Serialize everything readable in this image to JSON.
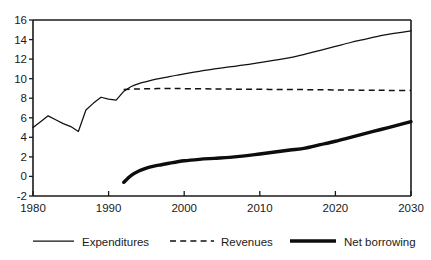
{
  "chart_data": {
    "type": "line",
    "title": "",
    "subtitle": "",
    "xlabel": "",
    "ylabel": "",
    "xlim": [
      1980,
      2030
    ],
    "ylim": [
      -2,
      16
    ],
    "xticks": [
      1980,
      1990,
      2000,
      2010,
      2020,
      2030
    ],
    "xticklabels": [
      "1980",
      "1990",
      "2000",
      "2010",
      "2020",
      "2030"
    ],
    "yticks": [
      -2,
      0,
      2,
      4,
      6,
      8,
      10,
      12,
      14,
      16
    ],
    "yticklabels": [
      "-2",
      "0",
      "2",
      "4",
      "6",
      "8",
      "10",
      "12",
      "14",
      "16"
    ],
    "grid": false,
    "legend_position": "bottom",
    "series": [
      {
        "name": "Expenditures",
        "style": "solid-thin",
        "x": [
          1980,
          1981,
          1982,
          1983,
          1984,
          1985,
          1986,
          1987,
          1988,
          1989,
          1990,
          1991,
          1992,
          1993,
          1994,
          1995,
          1996,
          1997,
          1998,
          1999,
          2000,
          2002,
          2004,
          2006,
          2008,
          2010,
          2012,
          2014,
          2016,
          2018,
          2020,
          2022,
          2024,
          2026,
          2028,
          2030
        ],
        "values": [
          5.0,
          5.6,
          6.2,
          5.8,
          5.4,
          5.1,
          4.6,
          6.8,
          7.5,
          8.1,
          7.9,
          7.8,
          8.7,
          9.2,
          9.5,
          9.7,
          9.9,
          10.05,
          10.2,
          10.35,
          10.5,
          10.75,
          11.0,
          11.2,
          11.4,
          11.65,
          11.9,
          12.15,
          12.5,
          12.9,
          13.3,
          13.7,
          14.05,
          14.4,
          14.65,
          14.9
        ]
      },
      {
        "name": "Revenues",
        "style": "dashed",
        "x": [
          1992,
          1994,
          1996,
          1998,
          2000,
          2004,
          2008,
          2012,
          2016,
          2020,
          2024,
          2027,
          2030
        ],
        "values": [
          8.9,
          8.95,
          8.98,
          9.0,
          8.98,
          8.95,
          8.92,
          8.9,
          8.88,
          8.85,
          8.82,
          8.8,
          8.78
        ]
      },
      {
        "name": "Net borrowing",
        "style": "solid-thick",
        "x": [
          1992,
          1993,
          1994,
          1995,
          1996,
          1997,
          1998,
          2000,
          2002,
          2004,
          2006,
          2008,
          2010,
          2012,
          2014,
          2016,
          2018,
          2020,
          2022,
          2024,
          2026,
          2028,
          2030
        ],
        "values": [
          -0.6,
          0.1,
          0.55,
          0.85,
          1.05,
          1.2,
          1.35,
          1.6,
          1.75,
          1.85,
          1.95,
          2.1,
          2.3,
          2.5,
          2.7,
          2.9,
          3.25,
          3.6,
          4.0,
          4.4,
          4.8,
          5.2,
          5.6
        ]
      }
    ],
    "legend": [
      {
        "label": "Expenditures",
        "style": "solid-thin"
      },
      {
        "label": "Revenues",
        "style": "dashed"
      },
      {
        "label": "Net borrowing",
        "style": "solid-thick"
      }
    ]
  }
}
